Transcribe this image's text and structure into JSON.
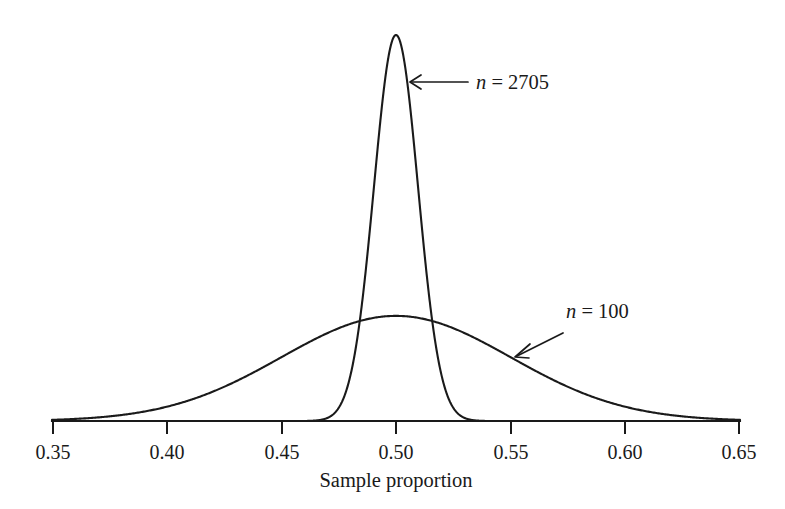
{
  "chart_data": {
    "type": "line",
    "title": "",
    "subtitle": "",
    "xlabel": "Sample proportion",
    "ylabel": "",
    "xlim": [
      0.35,
      0.65
    ],
    "ylim": [
      0,
      1
    ],
    "grid": false,
    "legend_position": "inline-annotations",
    "xticks": [
      0.35,
      0.4,
      0.45,
      0.5,
      0.55,
      0.6,
      0.65
    ],
    "xtick_labels": [
      "0.35",
      "0.40",
      "0.45",
      "0.50",
      "0.55",
      "0.60",
      "0.65"
    ],
    "yticks": [],
    "ytick_labels": [],
    "series": [
      {
        "name": "n = 2705",
        "distribution": "normal",
        "mean": 0.5,
        "sigma": 0.009613,
        "n": 2705,
        "peak_x": 0.5,
        "peak_height_relative": 1.0,
        "visible_range": [
          0.4615,
          0.5385
        ],
        "x": [
          0.4615,
          0.47,
          0.475,
          0.48,
          0.485,
          0.49,
          0.495,
          0.5,
          0.505,
          0.51,
          0.515,
          0.52,
          0.525,
          0.53,
          0.5385
        ],
        "y": [
          0.0003,
          0.0088,
          0.0425,
          0.1459,
          0.357,
          0.6219,
          0.8722,
          1.0,
          0.8722,
          0.6219,
          0.357,
          0.1459,
          0.0425,
          0.0088,
          0.0003
        ]
      },
      {
        "name": "n = 100",
        "distribution": "normal",
        "mean": 0.5,
        "sigma": 0.05,
        "n": 100,
        "peak_x": 0.5,
        "peak_height_relative": 0.2723,
        "visible_range": [
          0.35,
          0.65
        ],
        "x": [
          0.35,
          0.37,
          0.39,
          0.41,
          0.43,
          0.45,
          0.47,
          0.49,
          0.5,
          0.51,
          0.53,
          0.55,
          0.57,
          0.59,
          0.61,
          0.63,
          0.65
        ],
        "y": [
          0.003,
          0.0111,
          0.0349,
          0.093,
          0.2107,
          0.4059,
          0.6657,
          0.9231,
          1.0,
          0.9231,
          0.6657,
          0.4059,
          0.2107,
          0.093,
          0.0349,
          0.0111,
          0.003
        ]
      }
    ],
    "annotations": [
      {
        "text": "n = 2705",
        "label_var": "n",
        "label_rest": " = 2705",
        "points_to_series": "n = 2705",
        "arrow_direction": "left"
      },
      {
        "text": "n = 100",
        "label_var": "n",
        "label_rest": " = 100",
        "points_to_series": "n = 100",
        "arrow_direction": "down-left"
      }
    ],
    "colors": {
      "curve": "#1a1a1a",
      "axis": "#1a1a1a",
      "text": "#1a1a1a",
      "background": "#ffffff"
    }
  },
  "axis": {
    "label": "Sample proportion",
    "ticks": [
      {
        "value": "0.35"
      },
      {
        "value": "0.40"
      },
      {
        "value": "0.45"
      },
      {
        "value": "0.50"
      },
      {
        "value": "0.55"
      },
      {
        "value": "0.60"
      },
      {
        "value": "0.65"
      }
    ]
  },
  "annotations": {
    "narrow": {
      "var": "n",
      "rest": " = 2705"
    },
    "wide": {
      "var": "n",
      "rest": " = 100"
    }
  }
}
